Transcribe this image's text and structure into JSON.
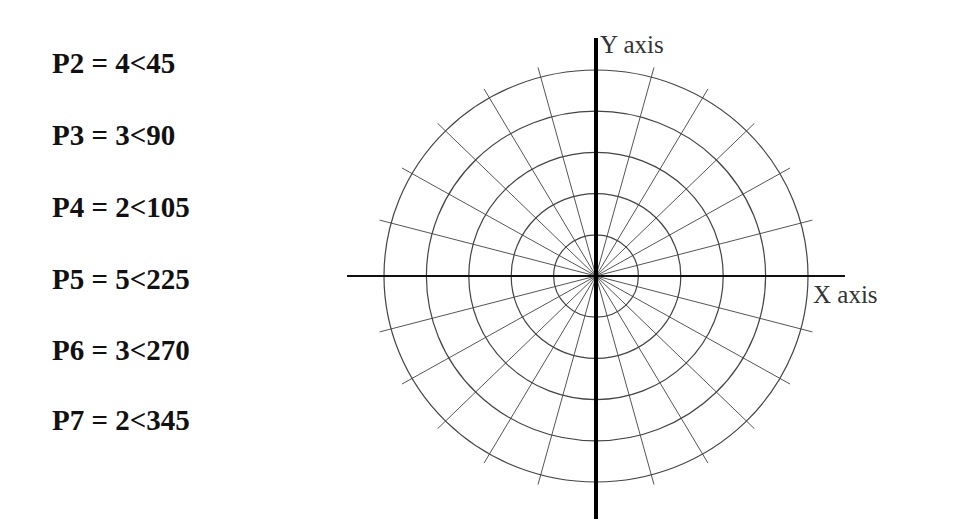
{
  "points": [
    {
      "name": "P2",
      "magnitude": 4,
      "angle": 45,
      "label": "P2 = 4<45"
    },
    {
      "name": "P3",
      "magnitude": 3,
      "angle": 90,
      "label": "P3 = 3<90"
    },
    {
      "name": "P4",
      "magnitude": 2,
      "angle": 105,
      "label": "P4 = 2<105"
    },
    {
      "name": "P5",
      "magnitude": 5,
      "angle": 225,
      "label": "P5 = 5<225"
    },
    {
      "name": "P6",
      "magnitude": 3,
      "angle": 270,
      "label": "P6 = 3<270"
    },
    {
      "name": "P7",
      "magnitude": 2,
      "angle": 345,
      "label": "P7 = 2<345"
    }
  ],
  "polar_grid": {
    "rings": 5,
    "spoke_interval_deg": 15,
    "spokes": 24
  },
  "axes": {
    "x_label": "X axis",
    "y_label": "Y axis"
  },
  "colors": {
    "text": "#111111",
    "axis": "#111111",
    "ring": "#444444",
    "spoke": "#555555"
  }
}
